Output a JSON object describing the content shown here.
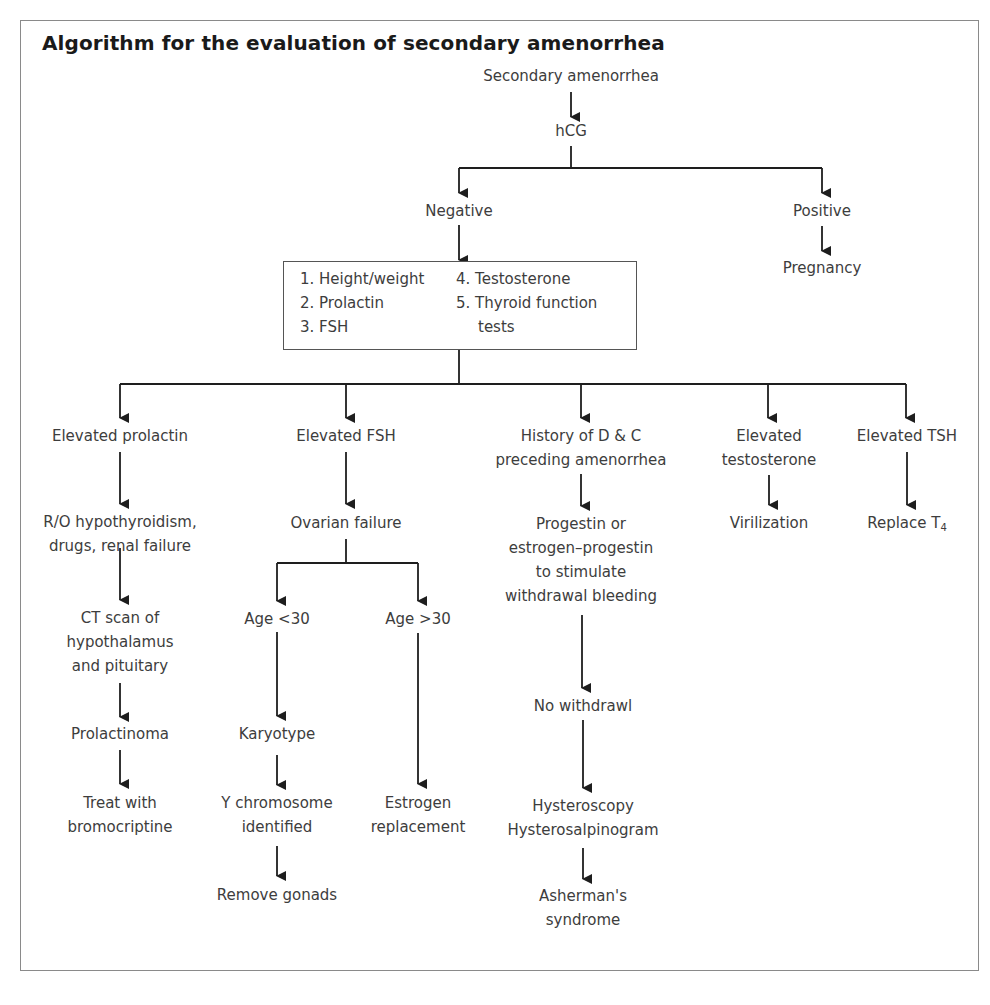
{
  "title": "Algorithm for the evaluation of secondary amenorrhea",
  "colors": {
    "line": "#1e1e1e",
    "frame": "#8a8a8a",
    "text": "#3d3d3d",
    "title": "#1a1a1a"
  },
  "nodes": {
    "root": "Secondary amenorrhea",
    "hcg": "hCG",
    "negative": "Negative",
    "positive": "Positive",
    "pregnancy": "Pregnancy",
    "tests": {
      "left": [
        "1.  Height/weight",
        "2. Prolactin",
        "3. FSH"
      ],
      "right": [
        "4. Testosterone",
        "5. Thyroid function",
        "    tests"
      ]
    },
    "prolactin_branch": {
      "elevated_prolactin": "Elevated prolactin",
      "rule_out": [
        "R/O hypothyroidism,",
        "drugs, renal failure"
      ],
      "ct_scan": [
        "CT scan of",
        "hypothalamus",
        "and pituitary"
      ],
      "prolactinoma": "Prolactinoma",
      "treat": [
        "Treat with",
        "bromocriptine"
      ]
    },
    "fsh_branch": {
      "elevated_fsh": "Elevated FSH",
      "ovarian_failure": "Ovarian failure",
      "age_under_30": "Age <30",
      "age_over_30": "Age >30",
      "karyotype": "Karyotype",
      "y_chromosome": [
        "Y chromosome",
        "identified"
      ],
      "remove_gonads": "Remove gonads",
      "estrogen": [
        "Estrogen",
        "replacement"
      ]
    },
    "dc_branch": {
      "history": [
        "History of D & C",
        "preceding amenorrhea"
      ],
      "progestin": [
        "Progestin or",
        "estrogen–progestin",
        "to stimulate",
        "withdrawal bleeding"
      ],
      "no_withdrawal": "No withdrawl",
      "hysteroscopy": [
        "Hysteroscopy",
        "Hysterosalpinogram"
      ],
      "asherman": [
        "Asherman's",
        "syndrome"
      ]
    },
    "testosterone_branch": {
      "elevated_testosterone": [
        "Elevated",
        "testosterone"
      ],
      "virilization": "Virilization"
    },
    "tsh_branch": {
      "elevated_tsh": "Elevated TSH",
      "replace_t4": "Replace T",
      "replace_t4_sub": "4"
    }
  }
}
